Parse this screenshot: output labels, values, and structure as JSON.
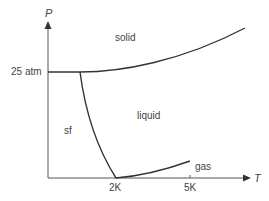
{
  "axes": {
    "y_label": "P",
    "x_label": "T",
    "y_tick": "25 atm",
    "x_ticks": [
      "2K",
      "5K"
    ]
  },
  "regions": {
    "solid": "solid",
    "liquid": "liquid",
    "superfluid": "sf",
    "gas": "gas"
  },
  "colors": {
    "line": "#333333",
    "text": "#444444",
    "background": "#ffffff"
  }
}
